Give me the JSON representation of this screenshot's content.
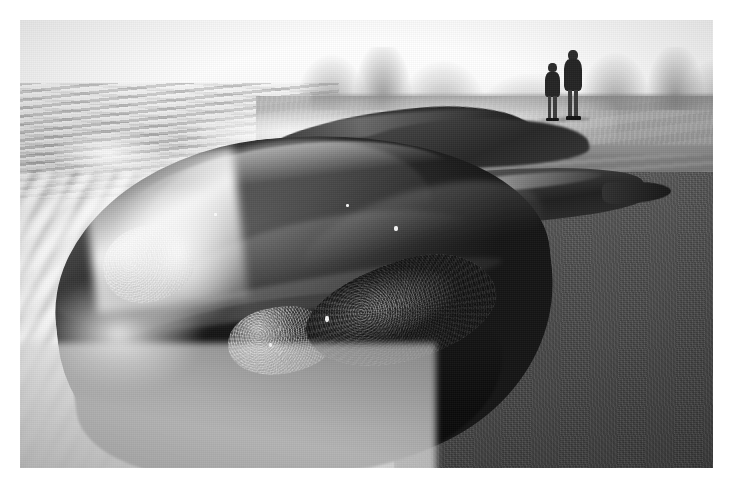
{
  "photograph": {
    "title": "Beached right whale in the surf",
    "medium": "black-and-white photograph",
    "orientation": "landscape",
    "border": {
      "style": "white mount",
      "width_px": 20,
      "color": "#ffffff"
    },
    "caption": ""
  },
  "palette": {
    "sky": "#ffffff",
    "sea_foam": "#ededed",
    "dry_sand": "#a8a8a8",
    "wet_sand": "#4e4e4e",
    "whale_body": "#1a1a1a",
    "whale_highlight": "#6b6b6b",
    "callosity": "#9c9c9c",
    "dune": "#9a9a9a"
  },
  "scene": {
    "regions": [
      {
        "name": "sky",
        "label": "Overexposed white sky",
        "position": "top"
      },
      {
        "name": "distant-dunes",
        "label": "Distant dunes and cliffs",
        "position": "upper-right"
      },
      {
        "name": "dry-beach",
        "label": "Dry upper beach",
        "position": "right"
      },
      {
        "name": "wet-shoreline",
        "label": "Wet reflective shoreline",
        "position": "upper-middle"
      },
      {
        "name": "ocean-waves",
        "label": "Breaking waves",
        "position": "upper-left"
      },
      {
        "name": "surf-foam",
        "label": "Motion-blurred surf foam",
        "position": "lower-left"
      },
      {
        "name": "wet-sand",
        "label": "Dark wet sand flat",
        "position": "lower-right"
      }
    ],
    "subjects": [
      {
        "name": "whale-head",
        "label": "Beached right whale head with callosities",
        "notes": "Large dark rounded rostrum lying in the surf, foreground"
      },
      {
        "name": "whale-body-background",
        "label": "Whale body and back further up the beach",
        "notes": "Darker elongated mass behind the head"
      },
      {
        "name": "pectoral-flipper",
        "label": "Pectoral flipper extended onto wet sand",
        "notes": "Pointed dark blade to the right of the head"
      },
      {
        "name": "callosity-rostrum",
        "label": "Callosity patch on rostrum"
      },
      {
        "name": "callosity-lip",
        "label": "Callosity patch along lower lip"
      },
      {
        "name": "callosity-ridge",
        "label": "Rough callosity ridge along jawline"
      }
    ],
    "people": [
      {
        "name": "person-left",
        "label": "Person standing on beach (left)",
        "count_index": 1
      },
      {
        "name": "person-right",
        "label": "Person standing on beach (right)",
        "count_index": 2
      }
    ],
    "people_count": 2
  }
}
